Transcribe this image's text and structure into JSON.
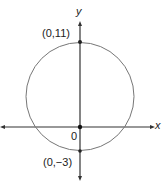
{
  "diagram": {
    "axes": {
      "x_label": "x",
      "y_label": "y",
      "origin_label": "0"
    },
    "circle": {
      "center": [
        0,
        4
      ],
      "radius": 7
    },
    "points": [
      {
        "label": "(0,11)",
        "coords": [
          0,
          11
        ]
      },
      {
        "label": "(0,−3)",
        "coords": [
          0,
          -3
        ]
      }
    ],
    "colors": {
      "axis": "#333333",
      "circle": "#777777",
      "point": "#222222"
    }
  }
}
